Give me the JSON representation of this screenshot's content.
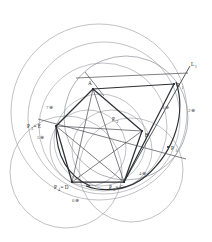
{
  "figure": {
    "background_color": "#ffffff",
    "ink_color": "#2f3034",
    "light_ink_color": "#8d9095",
    "width": 212,
    "height": 242
  },
  "points": {
    "A": {
      "label": "A",
      "x": 93,
      "y": 89
    },
    "B": {
      "label": "B",
      "x": 142,
      "y": 131
    },
    "C": {
      "label": "C",
      "x": 124,
      "y": 182
    },
    "D": {
      "label": "D",
      "x": 72,
      "y": 182
    },
    "E": {
      "label": "E",
      "x": 56,
      "y": 126
    },
    "P1": {
      "label": "P",
      "sub": "1",
      "x": 174,
      "y": 84
    },
    "P2": {
      "label": "P",
      "sub": "2",
      "x": 114,
      "y": 118
    },
    "P3": {
      "label": "P",
      "sub": "3",
      "x": 168,
      "y": 147
    },
    "P4": {
      "label": "P",
      "sub": "4",
      "x": 72,
      "y": 182
    },
    "P5": {
      "label": "P",
      "sub": "5",
      "x": 124,
      "y": 182
    }
  },
  "vertex_labels": [
    {
      "name": "label-A",
      "text": "A",
      "x": 91,
      "y": 85,
      "sub": ""
    },
    {
      "name": "label-B",
      "text": "B",
      "x": 144,
      "y": 136,
      "sub": ""
    },
    {
      "name": "label-P1",
      "text": "P",
      "x": 176,
      "y": 84,
      "sub": "1"
    },
    {
      "name": "label-P2",
      "text": "P",
      "x": 113,
      "y": 121,
      "sub": "2"
    },
    {
      "name": "label-P3",
      "text": "P",
      "x": 171,
      "y": 148,
      "sub": "3"
    },
    {
      "name": "label-P4-eq-D",
      "text": "P",
      "x": 62,
      "y": 186,
      "sub": "4",
      "suffix": " = D"
    },
    {
      "name": "label-P5-eq-C",
      "text": "P",
      "x": 118,
      "y": 186,
      "sub": "5",
      "suffix": " = C"
    },
    {
      "name": "label-P3-eq-E",
      "text": "P",
      "x": 32,
      "y": 127,
      "sub": "3",
      "suffix": " = E"
    }
  ],
  "line_labels": [
    {
      "name": "label-L1",
      "text": "L",
      "sub": "1",
      "x": 190,
      "y": 64
    }
  ],
  "circle_labels": [
    {
      "name": "circle-label-7",
      "text": "7⊕",
      "x": 49,
      "y": 107
    },
    {
      "name": "circle-label-5",
      "text": "5⊕",
      "x": 40,
      "y": 137
    },
    {
      "name": "circle-label-6",
      "text": "6⊕",
      "x": 75,
      "y": 200
    },
    {
      "name": "circle-label-4",
      "text": "4⊕",
      "x": 141,
      "y": 173
    },
    {
      "name": "circle-label-3",
      "text": "3⊕",
      "x": 164,
      "y": 107
    },
    {
      "name": "circle-label-2",
      "text": "2⊕",
      "x": 190,
      "y": 110
    }
  ],
  "arcs": [
    {
      "name": "outer-arc-1",
      "cx": 99,
      "cy": 112,
      "r": 88,
      "style": "thin"
    },
    {
      "name": "outer-arc-2",
      "cx": 104,
      "cy": 118,
      "r": 76,
      "style": "thin"
    },
    {
      "name": "outer-arc-3",
      "cx": 103,
      "cy": 127,
      "r": 64,
      "style": "thin"
    },
    {
      "name": "inner-arc-1",
      "cx": 100,
      "cy": 140,
      "r": 46,
      "style": "thin"
    },
    {
      "name": "lower-left-arc",
      "cx": 66,
      "cy": 172,
      "r": 56,
      "style": "thin"
    },
    {
      "name": "lower-right-arc",
      "cx": 131,
      "cy": 170,
      "r": 52,
      "style": "thin"
    },
    {
      "name": "right-arc",
      "cx": 126,
      "cy": 118,
      "r": 62,
      "style": "med"
    },
    {
      "name": "heavy-arc",
      "cx": 107,
      "cy": 122,
      "r": 68,
      "style": "dark"
    }
  ],
  "polygon": {
    "name": "pentagon-ABCDE",
    "vertices": [
      "A",
      "B",
      "C",
      "D",
      "E"
    ],
    "closed": true
  },
  "diagonals": [
    {
      "name": "diagonal-A-C",
      "from": "A",
      "to": "C"
    },
    {
      "name": "diagonal-A-D",
      "from": "A",
      "to": "D"
    },
    {
      "name": "diagonal-E-B",
      "from": "E",
      "to": "B"
    },
    {
      "name": "diagonal-E-C",
      "from": "E",
      "to": "C"
    },
    {
      "name": "diagonal-D-B",
      "from": "D",
      "to": "B"
    }
  ],
  "rays": [
    {
      "name": "ray-L1",
      "x1": 124,
      "y1": 182,
      "x2": 189,
      "y2": 68
    },
    {
      "name": "ray-A-P1",
      "x1": 78,
      "y1": 79,
      "x2": 186,
      "y2": 74
    },
    {
      "name": "ray-E-P3",
      "x1": 40,
      "y1": 120,
      "x2": 185,
      "y2": 158
    }
  ]
}
